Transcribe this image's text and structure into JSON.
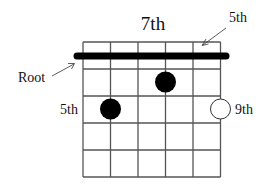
{
  "title": "7th",
  "labels": {
    "top_right": "5th",
    "root": "Root",
    "left_fret": "5th",
    "right_fret": "9th"
  },
  "diagram": {
    "strings": 6,
    "frets": 5,
    "barre": {
      "from_string": 1,
      "to_string": 6,
      "fret": 1
    },
    "dots": [
      {
        "type": "filled",
        "string": 4,
        "fret": 2
      },
      {
        "type": "filled",
        "string": 2,
        "fret": 3
      },
      {
        "type": "open",
        "string": 6,
        "fret": 3
      }
    ]
  },
  "colors": {
    "line": "#555555",
    "ink": "#000000"
  }
}
